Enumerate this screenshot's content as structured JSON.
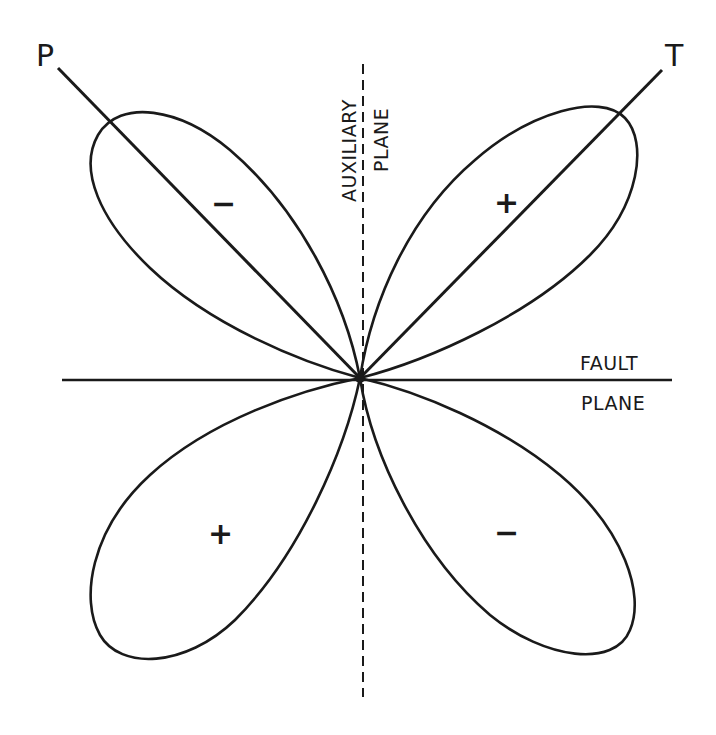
{
  "diagram": {
    "type": "focal-mechanism-radiation-pattern",
    "axes": {
      "p_axis_label": "P",
      "t_axis_label": "T"
    },
    "planes": {
      "auxiliary_line1": "AUXILIARY",
      "auxiliary_line2": "PLANE",
      "fault_line1": "FAULT",
      "fault_line2": "PLANE"
    },
    "lobes": [
      {
        "position": "upper-left",
        "sign": "−"
      },
      {
        "position": "upper-right",
        "sign": "+"
      },
      {
        "position": "lower-left",
        "sign": "+"
      },
      {
        "position": "lower-right",
        "sign": "−"
      }
    ],
    "colors": {
      "stroke": "#1a1a1a",
      "background": "#ffffff"
    }
  }
}
